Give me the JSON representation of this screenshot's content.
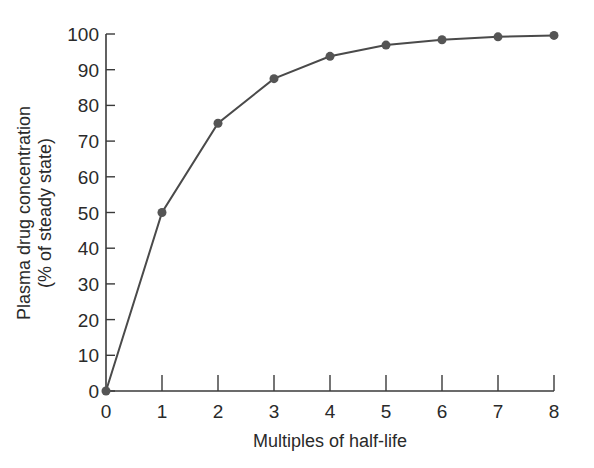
{
  "chart_data": {
    "type": "line",
    "title": "",
    "xlabel": "Multiples of half-life",
    "ylabel_lines": [
      "Plasma drug concentration",
      "(% of steady state)"
    ],
    "ylabel": "Plasma drug concentration (% of steady state)",
    "x": [
      0,
      1,
      2,
      3,
      4,
      5,
      6,
      7,
      8
    ],
    "series": [
      {
        "name": "Plasma drug concentration",
        "values": [
          0,
          50,
          75,
          87.5,
          93.75,
          96.9,
          98.4,
          99.2,
          99.6
        ]
      }
    ],
    "xlim": [
      0,
      8
    ],
    "ylim": [
      0,
      100
    ],
    "xticks": [
      0,
      1,
      2,
      3,
      4,
      5,
      6,
      7,
      8
    ],
    "yticks": [
      0,
      10,
      20,
      30,
      40,
      50,
      60,
      70,
      80,
      90,
      100
    ],
    "grid": false,
    "legend": "none",
    "markers": true,
    "colors": {
      "line": "#4a4a4a",
      "marker": "#555555",
      "axis": "#3a3a3a",
      "text": "#2a2a2a"
    }
  }
}
